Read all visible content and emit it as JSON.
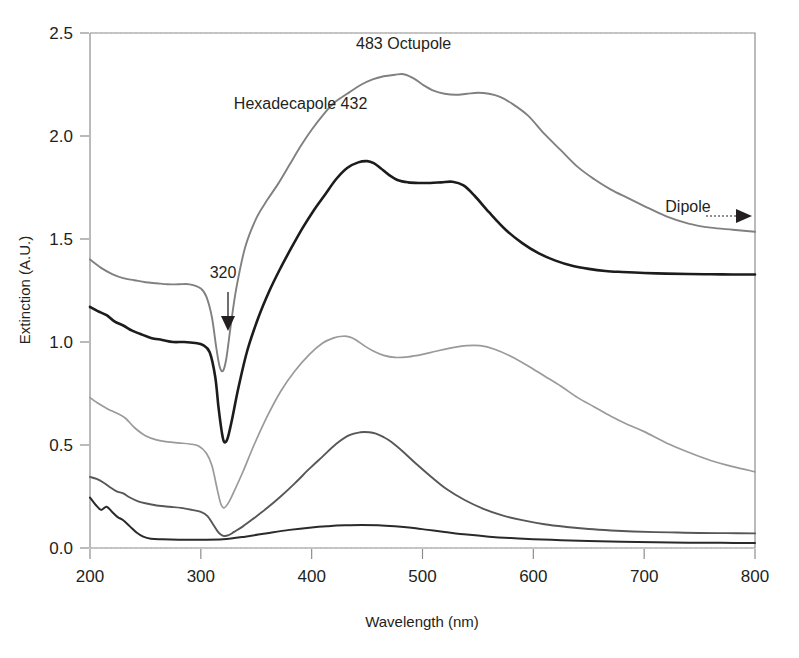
{
  "chart_data": {
    "type": "line",
    "title": "",
    "xlabel": "Wavelength (nm)",
    "ylabel": "Extinction (A.U.)",
    "xlim": [
      200,
      800
    ],
    "ylim": [
      0.0,
      2.5
    ],
    "xticks": [
      200,
      300,
      400,
      500,
      600,
      700,
      800
    ],
    "xtick_labels": [
      "200",
      "300",
      "400",
      "500",
      "600",
      "700",
      "800"
    ],
    "yticks": [
      0.0,
      0.5,
      1.0,
      1.5,
      2.0,
      2.5
    ],
    "ytick_labels": [
      "0.0",
      "0.5",
      "1.0",
      "1.5",
      "2.0",
      "2.5"
    ],
    "grid": false,
    "legend": "none",
    "annotations": [
      {
        "name": "octupole-label",
        "text": "483 Octupole",
        "x": 483,
        "y": 2.42
      },
      {
        "name": "hexadecapole-label",
        "text": "Hexadecapole 432",
        "x": 390,
        "y": 2.13
      },
      {
        "name": "dip-label",
        "text": "320",
        "x": 320,
        "y": 1.31
      },
      {
        "name": "dipole-label",
        "text": "Dipole",
        "x": 760,
        "y": 1.63
      }
    ],
    "series": [
      {
        "name": "Hexadecapole / Octupole (largest)",
        "color": "#808080",
        "x": [
          200,
          210,
          220,
          230,
          240,
          250,
          260,
          270,
          280,
          290,
          300,
          305,
          310,
          314,
          317,
          320,
          323,
          327,
          332,
          340,
          350,
          360,
          370,
          380,
          390,
          400,
          410,
          420,
          432,
          445,
          455,
          465,
          475,
          483,
          492,
          500,
          510,
          520,
          530,
          540,
          550,
          560,
          570,
          580,
          595,
          610,
          625,
          640,
          655,
          670,
          685,
          700,
          720,
          740,
          760,
          780,
          800
        ],
        "y": [
          1.4,
          1.36,
          1.33,
          1.31,
          1.3,
          1.29,
          1.285,
          1.28,
          1.28,
          1.28,
          1.26,
          1.22,
          1.12,
          0.97,
          0.88,
          0.86,
          0.92,
          1.08,
          1.26,
          1.46,
          1.6,
          1.69,
          1.77,
          1.86,
          1.95,
          2.03,
          2.1,
          2.16,
          2.205,
          2.25,
          2.275,
          2.29,
          2.297,
          2.3,
          2.28,
          2.25,
          2.22,
          2.205,
          2.2,
          2.205,
          2.21,
          2.205,
          2.19,
          2.16,
          2.1,
          2.01,
          1.93,
          1.85,
          1.79,
          1.74,
          1.7,
          1.66,
          1.61,
          1.575,
          1.555,
          1.545,
          1.535
        ]
      },
      {
        "name": "Octupole (second)",
        "color": "#1c1c1c",
        "x": [
          200,
          207,
          215,
          222,
          230,
          238,
          245,
          255,
          265,
          275,
          285,
          295,
          302,
          308,
          313,
          316,
          319,
          321,
          324,
          328,
          334,
          342,
          352,
          362,
          372,
          382,
          392,
          402,
          412,
          422,
          432,
          442,
          450,
          456,
          462,
          470,
          478,
          487,
          497,
          507,
          517,
          527,
          537,
          547,
          560,
          575,
          590,
          605,
          620,
          635,
          650,
          665,
          680,
          700,
          720,
          740,
          760,
          780,
          800
        ],
        "y": [
          1.17,
          1.15,
          1.13,
          1.1,
          1.08,
          1.055,
          1.04,
          1.02,
          1.01,
          1.0,
          1.0,
          0.995,
          0.985,
          0.95,
          0.83,
          0.68,
          0.56,
          0.515,
          0.53,
          0.62,
          0.78,
          0.96,
          1.12,
          1.25,
          1.36,
          1.46,
          1.555,
          1.64,
          1.715,
          1.79,
          1.845,
          1.872,
          1.878,
          1.868,
          1.845,
          1.81,
          1.785,
          1.775,
          1.772,
          1.772,
          1.775,
          1.778,
          1.76,
          1.71,
          1.63,
          1.545,
          1.48,
          1.43,
          1.395,
          1.37,
          1.355,
          1.345,
          1.34,
          1.335,
          1.332,
          1.33,
          1.329,
          1.328,
          1.328
        ]
      },
      {
        "name": "Quadrupole (third)",
        "color": "#9a9a9a",
        "x": [
          200,
          208,
          216,
          224,
          232,
          240,
          250,
          260,
          270,
          280,
          290,
          298,
          305,
          310,
          315,
          318,
          321,
          325,
          330,
          338,
          348,
          360,
          372,
          385,
          398,
          410,
          420,
          428,
          434,
          440,
          448,
          456,
          465,
          475,
          487,
          500,
          512,
          525,
          540,
          552,
          565,
          580,
          595,
          610,
          625,
          640,
          655,
          670,
          685,
          700,
          720,
          740,
          760,
          780,
          800
        ],
        "y": [
          0.73,
          0.7,
          0.675,
          0.655,
          0.63,
          0.585,
          0.545,
          0.525,
          0.515,
          0.51,
          0.505,
          0.495,
          0.46,
          0.4,
          0.28,
          0.215,
          0.195,
          0.22,
          0.275,
          0.37,
          0.5,
          0.64,
          0.76,
          0.86,
          0.94,
          0.995,
          1.02,
          1.028,
          1.025,
          1.01,
          0.98,
          0.955,
          0.935,
          0.925,
          0.928,
          0.94,
          0.955,
          0.97,
          0.982,
          0.982,
          0.965,
          0.93,
          0.885,
          0.835,
          0.785,
          0.73,
          0.685,
          0.64,
          0.6,
          0.565,
          0.51,
          0.465,
          0.425,
          0.395,
          0.37
        ]
      },
      {
        "name": "Quadrupole (fourth)",
        "color": "#575757",
        "x": [
          200,
          206,
          212,
          218,
          224,
          230,
          236,
          244,
          252,
          262,
          272,
          282,
          292,
          300,
          306,
          311,
          315,
          318,
          321,
          325,
          330,
          338,
          348,
          360,
          372,
          385,
          398,
          410,
          422,
          434,
          444,
          452,
          458,
          465,
          472,
          482,
          494,
          508,
          522,
          538,
          555,
          572,
          590,
          610,
          630,
          650,
          670,
          690,
          710,
          730,
          750,
          775,
          800
        ],
        "y": [
          0.345,
          0.335,
          0.318,
          0.295,
          0.275,
          0.265,
          0.245,
          0.225,
          0.215,
          0.205,
          0.2,
          0.195,
          0.185,
          0.175,
          0.155,
          0.115,
          0.082,
          0.065,
          0.058,
          0.062,
          0.078,
          0.105,
          0.145,
          0.195,
          0.25,
          0.315,
          0.385,
          0.445,
          0.505,
          0.548,
          0.562,
          0.562,
          0.555,
          0.538,
          0.515,
          0.47,
          0.41,
          0.345,
          0.285,
          0.233,
          0.19,
          0.158,
          0.135,
          0.115,
          0.102,
          0.092,
          0.085,
          0.08,
          0.077,
          0.075,
          0.073,
          0.072,
          0.071
        ]
      },
      {
        "name": "Dipole (smallest)",
        "color": "#2a2a2a",
        "x": [
          200,
          205,
          210,
          215,
          220,
          225,
          230,
          236,
          242,
          248,
          255,
          265,
          280,
          300,
          320,
          340,
          360,
          380,
          400,
          415,
          430,
          445,
          460,
          475,
          490,
          505,
          520,
          540,
          560,
          580,
          600,
          625,
          650,
          680,
          710,
          740,
          770,
          800
        ],
        "y": [
          0.245,
          0.21,
          0.185,
          0.2,
          0.175,
          0.15,
          0.135,
          0.105,
          0.075,
          0.055,
          0.045,
          0.042,
          0.04,
          0.04,
          0.042,
          0.055,
          0.072,
          0.088,
          0.1,
          0.106,
          0.11,
          0.112,
          0.11,
          0.105,
          0.098,
          0.088,
          0.078,
          0.065,
          0.055,
          0.048,
          0.043,
          0.038,
          0.034,
          0.03,
          0.028,
          0.026,
          0.025,
          0.024
        ]
      }
    ]
  },
  "axis_colors": {
    "frame": "#8d8d8d",
    "tick": "#8d8d8d",
    "zero_line": "#b8b8b8",
    "text": "#231f20"
  }
}
